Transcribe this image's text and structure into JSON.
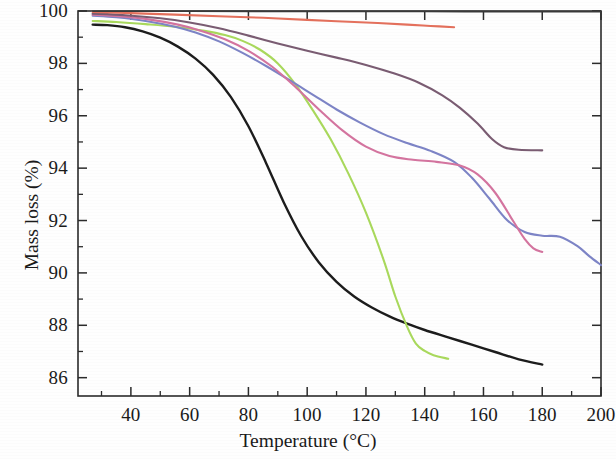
{
  "chart_data": {
    "type": "line",
    "title": "",
    "xlabel": "Temperature (°C)",
    "ylabel": "Mass loss (%)",
    "xlim": [
      22,
      200
    ],
    "ylim": [
      85.3,
      100
    ],
    "xticks": [
      40,
      60,
      80,
      100,
      120,
      140,
      160,
      180,
      200
    ],
    "xtick_labels": [
      "40",
      "60",
      "80",
      "100",
      "120",
      "140",
      "160",
      "180",
      "200"
    ],
    "x_minor_tick_step": 10,
    "yticks": [
      86,
      88,
      90,
      92,
      94,
      96,
      98,
      100
    ],
    "ytick_labels": [
      "86",
      "88",
      "90",
      "92",
      "94",
      "96",
      "98",
      "100"
    ],
    "y_minor_tick_step": 1,
    "grid": false,
    "legend": "none",
    "frame": "box",
    "series": [
      {
        "name": "black-curve",
        "color": "#1c1c1c",
        "width": 2.4,
        "points": [
          [
            27,
            99.48
          ],
          [
            32,
            99.46
          ],
          [
            38,
            99.38
          ],
          [
            44,
            99.22
          ],
          [
            50,
            98.98
          ],
          [
            56,
            98.64
          ],
          [
            62,
            98.18
          ],
          [
            68,
            97.56
          ],
          [
            74,
            96.72
          ],
          [
            80,
            95.6
          ],
          [
            86,
            94.2
          ],
          [
            92,
            92.7
          ],
          [
            98,
            91.4
          ],
          [
            104,
            90.4
          ],
          [
            110,
            89.66
          ],
          [
            116,
            89.1
          ],
          [
            122,
            88.68
          ],
          [
            128,
            88.34
          ],
          [
            134,
            88.06
          ],
          [
            140,
            87.82
          ],
          [
            148,
            87.54
          ],
          [
            156,
            87.26
          ],
          [
            164,
            86.98
          ],
          [
            172,
            86.7
          ],
          [
            180,
            86.5
          ]
        ]
      },
      {
        "name": "green-curve",
        "color": "#a9d95c",
        "width": 2.1,
        "points": [
          [
            27,
            99.62
          ],
          [
            35,
            99.58
          ],
          [
            45,
            99.5
          ],
          [
            55,
            99.4
          ],
          [
            65,
            99.24
          ],
          [
            72,
            99.08
          ],
          [
            78,
            98.86
          ],
          [
            84,
            98.52
          ],
          [
            90,
            98.0
          ],
          [
            96,
            97.2
          ],
          [
            102,
            96.2
          ],
          [
            108,
            95.1
          ],
          [
            114,
            93.8
          ],
          [
            120,
            92.3
          ],
          [
            126,
            90.5
          ],
          [
            130,
            89.1
          ],
          [
            134,
            87.95
          ],
          [
            137,
            87.3
          ],
          [
            140,
            87.02
          ],
          [
            143,
            86.86
          ],
          [
            148,
            86.72
          ]
        ]
      },
      {
        "name": "blue-curve",
        "color": "#7d84c6",
        "width": 2.1,
        "points": [
          [
            27,
            99.82
          ],
          [
            35,
            99.76
          ],
          [
            45,
            99.62
          ],
          [
            55,
            99.4
          ],
          [
            62,
            99.18
          ],
          [
            70,
            98.84
          ],
          [
            78,
            98.4
          ],
          [
            86,
            97.9
          ],
          [
            94,
            97.36
          ],
          [
            102,
            96.8
          ],
          [
            110,
            96.24
          ],
          [
            118,
            95.74
          ],
          [
            126,
            95.3
          ],
          [
            134,
            94.96
          ],
          [
            142,
            94.66
          ],
          [
            150,
            94.24
          ],
          [
            156,
            93.64
          ],
          [
            162,
            92.84
          ],
          [
            168,
            92.02
          ],
          [
            174,
            91.56
          ],
          [
            180,
            91.42
          ],
          [
            186,
            91.38
          ],
          [
            192,
            91.02
          ],
          [
            196,
            90.64
          ],
          [
            200,
            90.3
          ]
        ]
      },
      {
        "name": "magenta-curve",
        "color": "#d4749f",
        "width": 2.1,
        "points": [
          [
            27,
            99.86
          ],
          [
            36,
            99.8
          ],
          [
            46,
            99.68
          ],
          [
            56,
            99.48
          ],
          [
            64,
            99.24
          ],
          [
            72,
            98.92
          ],
          [
            80,
            98.48
          ],
          [
            88,
            97.88
          ],
          [
            96,
            97.1
          ],
          [
            104,
            96.24
          ],
          [
            112,
            95.44
          ],
          [
            120,
            94.82
          ],
          [
            128,
            94.46
          ],
          [
            136,
            94.32
          ],
          [
            144,
            94.24
          ],
          [
            152,
            94.1
          ],
          [
            158,
            93.76
          ],
          [
            164,
            93.06
          ],
          [
            170,
            92.0
          ],
          [
            174,
            91.3
          ],
          [
            177,
            90.94
          ],
          [
            180,
            90.8
          ]
        ]
      },
      {
        "name": "plum-curve",
        "color": "#7a5c72",
        "width": 2.1,
        "points": [
          [
            27,
            99.9
          ],
          [
            38,
            99.84
          ],
          [
            50,
            99.72
          ],
          [
            60,
            99.56
          ],
          [
            70,
            99.34
          ],
          [
            80,
            99.06
          ],
          [
            90,
            98.76
          ],
          [
            100,
            98.48
          ],
          [
            110,
            98.22
          ],
          [
            120,
            97.94
          ],
          [
            130,
            97.6
          ],
          [
            138,
            97.26
          ],
          [
            146,
            96.78
          ],
          [
            152,
            96.3
          ],
          [
            158,
            95.7
          ],
          [
            163,
            95.1
          ],
          [
            167,
            94.8
          ],
          [
            172,
            94.7
          ],
          [
            180,
            94.68
          ]
        ]
      },
      {
        "name": "salmon-curve",
        "color": "#e4705c",
        "width": 2.1,
        "points": [
          [
            27,
            99.96
          ],
          [
            40,
            99.92
          ],
          [
            55,
            99.86
          ],
          [
            70,
            99.8
          ],
          [
            85,
            99.74
          ],
          [
            100,
            99.66
          ],
          [
            112,
            99.6
          ],
          [
            124,
            99.54
          ],
          [
            134,
            99.48
          ],
          [
            142,
            99.43
          ],
          [
            150,
            99.38
          ]
        ]
      },
      {
        "name": "top-dark-curve",
        "color": "#3a3a3a",
        "width": 1.6,
        "points": [
          [
            27,
            99.99
          ],
          [
            60,
            99.99
          ],
          [
            100,
            99.98
          ],
          [
            140,
            99.98
          ],
          [
            180,
            99.97
          ],
          [
            200,
            99.97
          ]
        ]
      }
    ]
  },
  "axes": {
    "ylabel": "Mass loss (%)",
    "xlabel": "Temperature (°C)",
    "ytick_labels": [
      "100",
      "98",
      "96",
      "94",
      "92",
      "90",
      "88",
      "86"
    ],
    "xtick_labels": [
      "40",
      "60",
      "80",
      "100",
      "120",
      "140",
      "160",
      "180",
      "200"
    ]
  }
}
